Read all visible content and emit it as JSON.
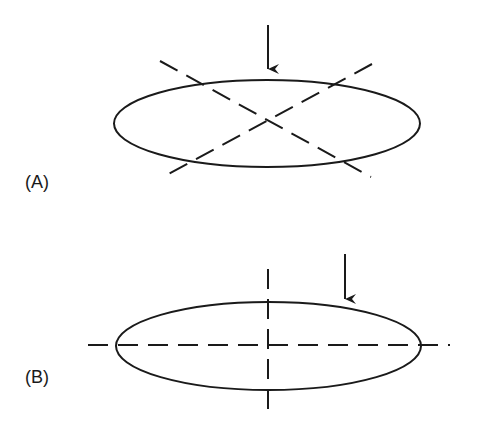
{
  "panels": [
    {
      "id": "A",
      "label": "(A)",
      "ellipse": {
        "cx": 267,
        "cy": 123.5,
        "rx": 153,
        "ry": 43.5
      },
      "arrow": {
        "x": 268,
        "y1": 25,
        "y2": 80,
        "direction": "down"
      },
      "dashed_lines": [
        {
          "x1": 160,
          "y1": 61,
          "x2": 371,
          "y2": 177
        },
        {
          "x1": 372,
          "y1": 64,
          "x2": 161,
          "y2": 178
        }
      ],
      "description": "Ellipse with diagonal dashed axes crossing at center; vertical arrow pointing down to top of ellipse at center"
    },
    {
      "id": "B",
      "label": "(B)",
      "ellipse": {
        "cx": 268.5,
        "cy": 346,
        "rx": 152.5,
        "ry": 44
      },
      "arrow": {
        "x": 345,
        "y1": 254,
        "y2": 310,
        "direction": "down"
      },
      "dashed_lines": [
        {
          "x1": 88,
          "y1": 345,
          "x2": 450,
          "y2": 345
        },
        {
          "x1": 268,
          "y1": 269,
          "x2": 268,
          "y2": 418
        }
      ],
      "description": "Ellipse with horizontal and vertical dashed principal axes; vertical arrow pointing down to ellipse off-center to the right"
    }
  ],
  "style": {
    "stroke_color": "#1a1a1a",
    "background": "#ffffff",
    "dash_pattern": "20 10"
  }
}
